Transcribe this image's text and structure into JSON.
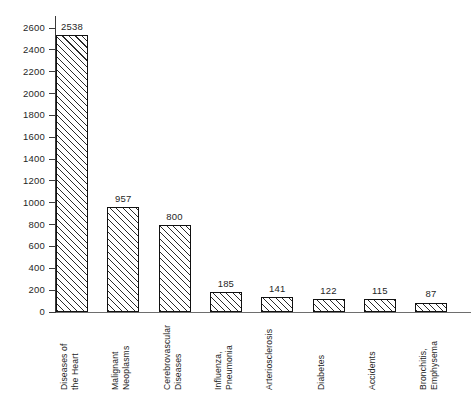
{
  "chart_data": {
    "type": "bar",
    "title": "",
    "subtitle": "",
    "xlabel": "",
    "ylabel": "",
    "ylim": [
      0,
      2700
    ],
    "ytick_step": 200,
    "grid": false,
    "legend": null,
    "axis_color": "#3a3a3a",
    "bar_outline_color": "#111111",
    "bar_fill": "diagonal-hatch",
    "background": "#ffffff",
    "yticks": [
      0,
      200,
      400,
      600,
      800,
      1000,
      1200,
      1400,
      1600,
      1800,
      2000,
      2200,
      2400,
      2600
    ],
    "ytick_labels": [
      "0",
      "200",
      "400",
      "600",
      "800",
      "1000",
      "1200",
      "1400",
      "1600",
      "1800",
      "2000",
      "2200",
      "2400",
      "2600"
    ],
    "categories": [
      "Diseases of the Heart",
      "Malignant Neoplasms",
      "Cerebrovascular Diseases",
      "Influenza, Pneumonia",
      "Arteriosclerosis",
      "Diabetes",
      "Accidents",
      "Bronchitis, Emphysema"
    ],
    "category_lines": [
      [
        "Diseases of",
        "the Heart"
      ],
      [
        "Malignant",
        "Neoplasms"
      ],
      [
        "Cerebrovascular",
        "Diseases"
      ],
      [
        "Influenza,",
        "Pneumonia"
      ],
      [
        "Arteriosclerosis",
        ""
      ],
      [
        "Diabetes",
        ""
      ],
      [
        "Accidents",
        ""
      ],
      [
        "Bronchitis,",
        "Emphysema"
      ]
    ],
    "values": [
      2538,
      957,
      800,
      185,
      141,
      122,
      115,
      87
    ],
    "value_labels": [
      "2538",
      "957",
      "800",
      "185",
      "141",
      "122",
      "115",
      "87"
    ]
  }
}
